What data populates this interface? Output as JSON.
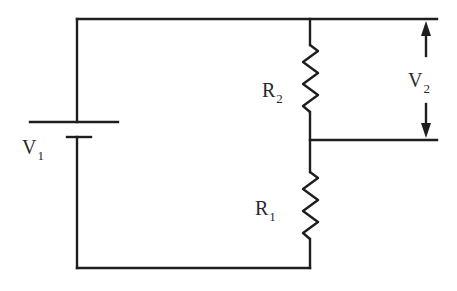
{
  "diagram": {
    "type": "circuit",
    "components": {
      "source": {
        "symbol": "V",
        "subscript": "1",
        "kind": "battery"
      },
      "resistor_top": {
        "symbol": "R",
        "subscript": "2",
        "kind": "resistor"
      },
      "resistor_bottom": {
        "symbol": "R",
        "subscript": "1",
        "kind": "resistor"
      },
      "output": {
        "symbol": "V",
        "subscript": "2",
        "kind": "voltage-across-R2"
      }
    },
    "colors": {
      "line": "#1e1e1e",
      "text": "#2a2a2a",
      "background": "#ffffff"
    }
  }
}
